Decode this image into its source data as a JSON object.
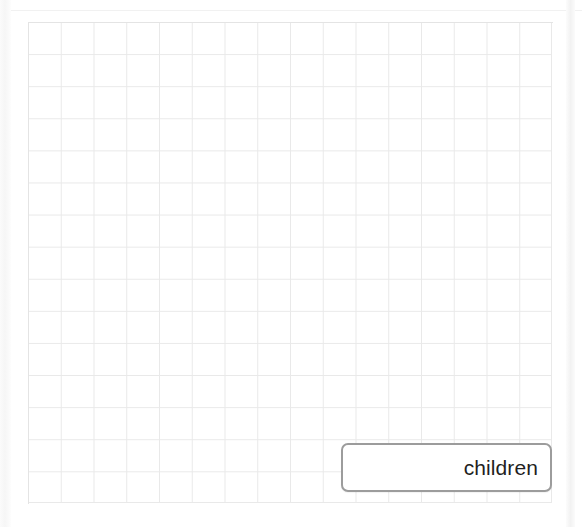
{
  "page": {
    "background_color": "#ffffff",
    "width": 582,
    "height": 527
  },
  "grid": {
    "name": "graph-paper-grid",
    "columns": 16,
    "rows": 15,
    "cell_width": 33,
    "cell_height": 32,
    "line_color": "#e9e9e9",
    "left": 28,
    "top": 22,
    "width": 524,
    "height": 481
  },
  "answer_box": {
    "value": "children",
    "placeholder": "",
    "text_align": "right",
    "border_color": "#9c9c9c",
    "text_color": "#1f1f1f",
    "background_color": "#ffffff",
    "left": 341,
    "top": 443,
    "width": 211,
    "height": 49
  },
  "decorations": {
    "top_rule_color": "#f1f1f1",
    "left_gutter_color": "#f6f6f6",
    "right_gutter_color": "#f2f2f2"
  }
}
